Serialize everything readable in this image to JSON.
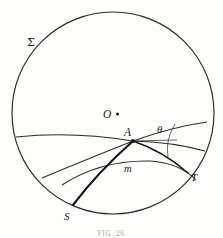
{
  "figure": {
    "caption": "FIG. 26",
    "labels": {
      "boundary": "Σ",
      "center": "O",
      "vertex": "A",
      "angle": "θ",
      "curve_m": "m",
      "point_s": "S",
      "point_t": "T"
    },
    "colors": {
      "ink": "#1a1a1a",
      "line": "#2b2b2b",
      "bold_line": "#141414",
      "background": "#fdfdfb"
    },
    "geometry": {
      "boundary_circle": {
        "cx": 113,
        "cy": 113,
        "r": 101
      },
      "center_dot": {
        "x": 117,
        "y": 114
      },
      "vertex_point": {
        "x": 133,
        "y": 141
      },
      "point_s": {
        "x": 73,
        "y": 205
      },
      "point_t": {
        "x": 188,
        "y": 173
      },
      "angle_degrees": 30
    },
    "elements": [
      "boundary-circle",
      "center-dot",
      "geodesic-upper-left",
      "geodesic-lower-left",
      "geodesic-upper-right",
      "geodesic-lower-right",
      "geodesic-m",
      "bold-geodesic-s-t",
      "angle-arc-theta"
    ]
  }
}
